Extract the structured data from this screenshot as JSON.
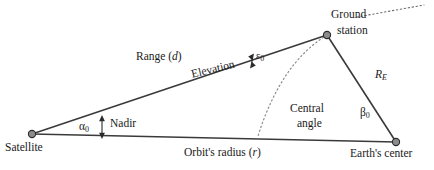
{
  "figure": {
    "type": "geometry-diagram",
    "colors": {
      "line": "#3a3a3a",
      "node_fill": "#8c8c8c",
      "node_stroke": "#2b2b2b",
      "dotted": "#8a8a8a",
      "text": "#1a1a1a",
      "background": "#ffffff"
    }
  },
  "nodes": {
    "satellite": {
      "label": "Satellite",
      "x": 32,
      "y": 134
    },
    "ground_station": {
      "label_line1": "Ground",
      "label_line2": "station",
      "x": 327,
      "y": 35
    },
    "earth_center": {
      "label": "Earth's center",
      "x": 396,
      "y": 142
    }
  },
  "edges": {
    "range": {
      "label_text": "Range (",
      "label_var": "d",
      "label_close": ")"
    },
    "elevation": {
      "label": "Elevation"
    },
    "earth_radius": {
      "label_var": "R",
      "label_sub": "E"
    },
    "orbit_radius": {
      "label_text": "Orbit's radius (",
      "label_var": "r",
      "label_close": ")"
    }
  },
  "angles": {
    "nadir": {
      "symbol": "α",
      "subscript": "0",
      "label": "Nadir"
    },
    "elevation_angle": {
      "symbol": "ε",
      "subscript": "0"
    },
    "central": {
      "symbol": "β",
      "subscript": "0",
      "label_line1": "Central",
      "label_line2": "angle"
    }
  },
  "annotations": {
    "horizon_dotted_line": "dotted horizon line from ground station to upper right",
    "earth_surface_arc": "dotted arc representing Earth's surface"
  }
}
